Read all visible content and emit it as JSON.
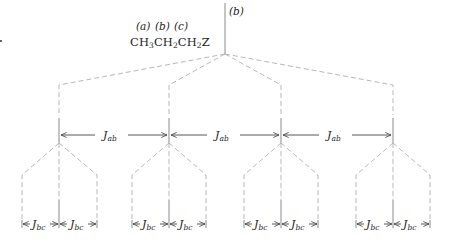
{
  "molecule": {
    "formula_parts": [
      "CH",
      "3",
      "CH",
      "2",
      "CH",
      "2",
      "Z"
    ],
    "position_labels": [
      "(a)",
      "(b)",
      "(c)"
    ]
  },
  "peak_label": "(b)",
  "coupling_labels": {
    "ab": {
      "J": "J",
      "sub": "ab"
    },
    "bc": {
      "J": "J",
      "sub": "bc"
    }
  },
  "colors": {
    "dashed_line": "#b8b8b8",
    "solid_line": "#8a8a8a",
    "arrow": "#444444",
    "text": "#222222"
  },
  "tree": {
    "apex": {
      "x": 225,
      "y": 54
    },
    "level1_x": [
      59,
      169,
      281,
      393
    ],
    "level2_groups": [
      {
        "center": 59,
        "left": 22,
        "right": 97
      },
      {
        "center": 169,
        "left": 132,
        "right": 206
      },
      {
        "center": 281,
        "left": 244,
        "right": 318
      },
      {
        "center": 393,
        "left": 356,
        "right": 430
      }
    ]
  }
}
